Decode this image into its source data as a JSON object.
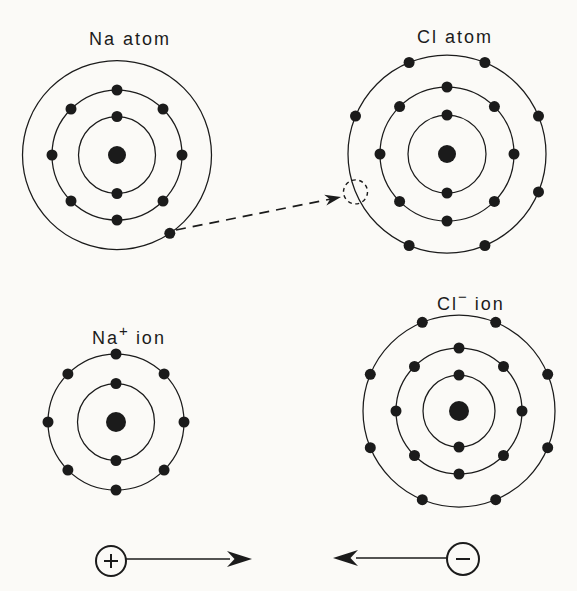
{
  "diagram": {
    "background": "#fbfaf7",
    "ink": "#1b1b1b",
    "description_semantics": "Bohr diagrams of sodium and chlorine atoms transferring one electron to form Na+ and Cl- ions",
    "atoms": [
      {
        "id": "na-atom",
        "label": "Na atom",
        "label_x": 130,
        "label_y": 45,
        "cx": 117,
        "cy": 155,
        "nucleus_r": 9,
        "electron_r": 5.5,
        "shells": [
          {
            "r": 38.5,
            "electron_angles": [
              90,
              270
            ]
          },
          {
            "r": 65,
            "electron_angles": [
              90,
              135,
              180,
              225,
              270,
              315,
              0,
              45
            ]
          },
          {
            "r": 94.5,
            "electron_angles": [
              -56
            ]
          }
        ]
      },
      {
        "id": "cl-atom",
        "label": "Cl atom",
        "label_x": 455,
        "label_y": 43,
        "cx": 447,
        "cy": 154,
        "nucleus_r": 9,
        "electron_r": 5.5,
        "shells": [
          {
            "r": 39,
            "electron_angles": [
              90,
              270
            ]
          },
          {
            "r": 67,
            "electron_angles": [
              90,
              135,
              180,
              225,
              270,
              315,
              0,
              45
            ]
          },
          {
            "r": 99,
            "electron_angles": [
              112.5,
              67.5,
              22.5,
              337.5,
              292.5,
              247.5,
              157.5
            ],
            "vacancy": {
              "angle": 202.5,
              "r": 12
            }
          }
        ]
      },
      {
        "id": "na-ion",
        "label_base": "Na",
        "label_sup": "+",
        "label_rest": "ion",
        "label_x": 129,
        "label_y": 344,
        "cx": 116,
        "cy": 422,
        "nucleus_r": 10,
        "electron_r": 5.5,
        "shells": [
          {
            "r": 38.5,
            "electron_angles": [
              90,
              270
            ]
          },
          {
            "r": 68,
            "electron_angles": [
              90,
              135,
              180,
              225,
              270,
              315,
              0,
              45
            ]
          }
        ]
      },
      {
        "id": "cl-ion",
        "label_base": "Cl",
        "label_sup": "−",
        "label_rest": "ion",
        "label_x": 471,
        "label_y": 310,
        "cx": 459,
        "cy": 411,
        "nucleus_r": 10,
        "electron_r": 5.5,
        "shells": [
          {
            "r": 36,
            "electron_angles": [
              90,
              270
            ]
          },
          {
            "r": 63,
            "electron_angles": [
              90,
              135,
              180,
              225,
              270,
              315,
              0,
              45
            ]
          },
          {
            "r": 96,
            "electron_angles": [
              22.5,
              67.5,
              112.5,
              157.5,
              202.5,
              247.5,
              292.5,
              337.5
            ]
          }
        ]
      }
    ],
    "transfer_arrow": {
      "x1": 176,
      "y1": 230,
      "x2": 341,
      "y2": 197,
      "dash": "10 7"
    },
    "charge_arrows": {
      "positive": {
        "sign": "+",
        "circle_cx": 111,
        "circle_cy": 561,
        "circle_r": 15,
        "line_x1": 126,
        "line_x2": 230,
        "tip_x": 252,
        "y": 559,
        "direction": "right"
      },
      "negative": {
        "sign": "−",
        "circle_cx": 463,
        "circle_cy": 559,
        "circle_r": 16,
        "line_x1": 447,
        "line_x2": 356,
        "tip_x": 333,
        "y": 558,
        "direction": "left"
      }
    }
  }
}
